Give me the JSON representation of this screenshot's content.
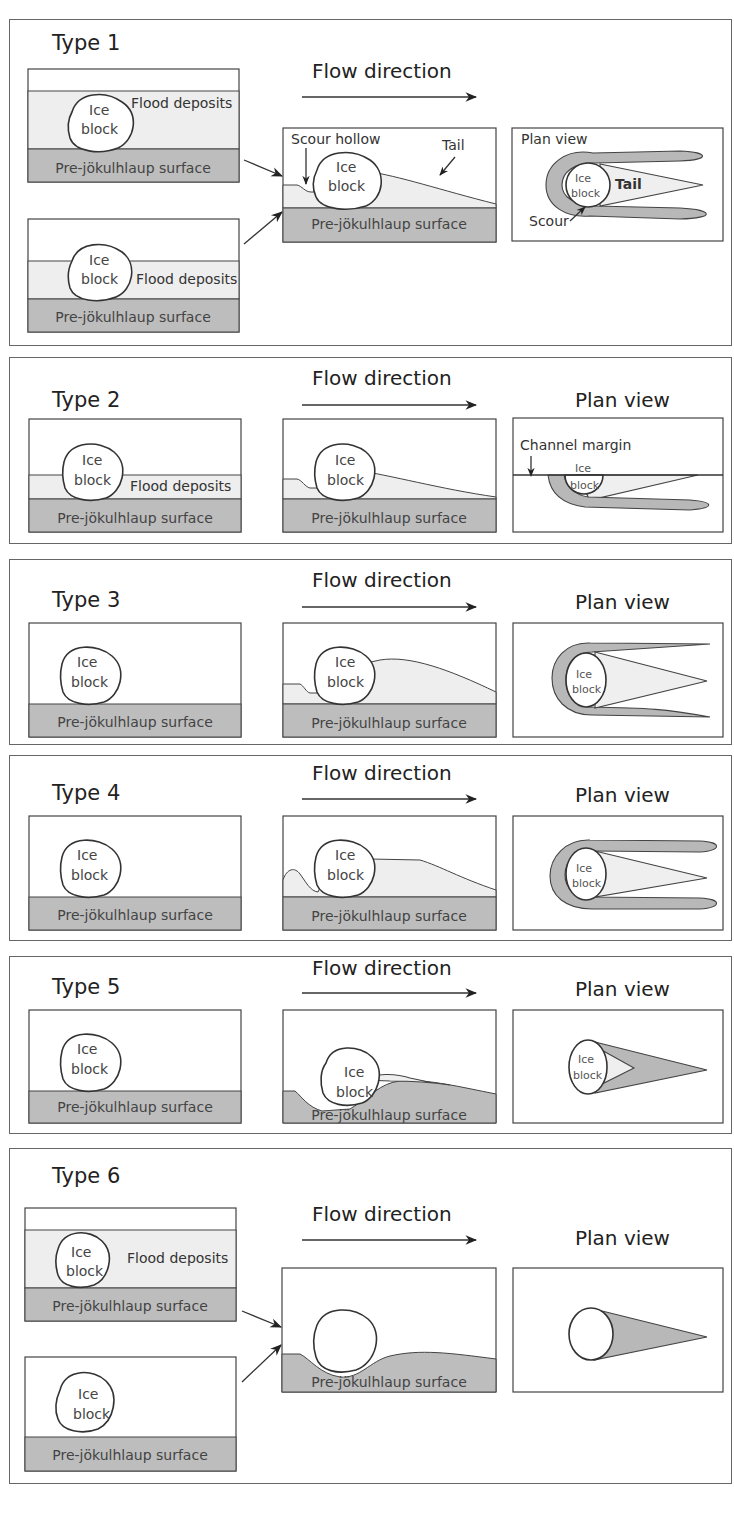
{
  "figure": {
    "flow_label": "Flow direction",
    "plan_view_label": "Plan view",
    "ice_line1": "Ice",
    "ice_line2": "block",
    "surface_label": "Pre-jökulhlaup surface",
    "flood_deposits_label": "Flood deposits",
    "colors": {
      "flood_deposits": "#eeeeee",
      "pre_jokulhlaup_surface": "#bdbdbd",
      "outline": "#444444",
      "text": "#222222"
    }
  },
  "panels": [
    {
      "type_label": "Type 1",
      "annotations": {
        "scour_hollow": "Scour hollow",
        "tail": "Tail",
        "plan_view_inset": "Plan view",
        "plan_tail": "Tail",
        "scour": "Scour"
      }
    },
    {
      "type_label": "Type 2",
      "annotations": {
        "channel_margin": "Channel margin"
      }
    },
    {
      "type_label": "Type 3"
    },
    {
      "type_label": "Type 4"
    },
    {
      "type_label": "Type 5"
    },
    {
      "type_label": "Type 6"
    }
  ]
}
